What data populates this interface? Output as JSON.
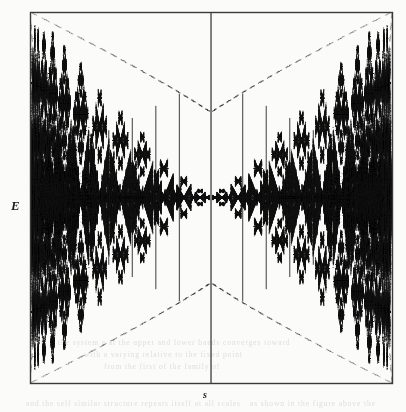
{
  "figure": {
    "kind": "scientific-figure-scan",
    "title_visible": "",
    "background_color": "#fbfbfa",
    "ink_color": "#141414",
    "frame": {
      "color": "#3a3a3a",
      "line_width": 1.4,
      "x": 30,
      "y": 12,
      "width": 362,
      "height": 371
    },
    "axes": {
      "y_label": "E",
      "y_label_style": "italic",
      "x_label": "s",
      "x_label_style": "italic",
      "ticks_visible": false,
      "tick_labels": [],
      "gridlines": false
    }
  },
  "chart_data": {
    "type": "scatter",
    "title": "",
    "xlabel": "s",
    "ylabel": "E",
    "xlim": [
      -1,
      1
    ],
    "ylim": [
      -1,
      1
    ],
    "grid": false,
    "legend": null,
    "symmetry": [
      "mirror-x",
      "mirror-y"
    ],
    "focal_points": [
      {
        "x": -0.95,
        "y": 0.0,
        "weight": 1.0
      },
      {
        "x": 0.95,
        "y": 0.0,
        "weight": 1.0
      }
    ],
    "central_axis_line": {
      "x": 0.0,
      "from_y": -1.0,
      "to_y": 1.0,
      "weight": 0.85
    },
    "band_centers_right": [
      0.06,
      0.15,
      0.26,
      0.38,
      0.5,
      0.615,
      0.72,
      0.81,
      0.875,
      0.923,
      0.955,
      0.974,
      0.986
    ],
    "band_widths_right": [
      0.03,
      0.042,
      0.055,
      0.062,
      0.06,
      0.055,
      0.048,
      0.04,
      0.032,
      0.024,
      0.017,
      0.012,
      0.008
    ],
    "band_amplitudes": [
      0.03,
      0.075,
      0.135,
      0.2,
      0.265,
      0.33,
      0.39,
      0.44,
      0.48,
      0.505,
      0.52,
      0.528,
      0.532
    ],
    "vertical_separators_right": [
      0.175,
      0.305,
      0.435,
      0.565,
      0.685,
      0.785,
      0.862
    ],
    "envelope_arcs": [
      {
        "from": [
          -1.0,
          1.0
        ],
        "to": [
          0.0,
          0.46
        ],
        "style": "dotted"
      },
      {
        "from": [
          1.0,
          1.0
        ],
        "to": [
          0.0,
          0.46
        ],
        "style": "dotted"
      },
      {
        "from": [
          -1.0,
          -1.0
        ],
        "to": [
          0.0,
          -0.46
        ],
        "style": "dotted"
      },
      {
        "from": [
          1.0,
          -1.0
        ],
        "to": [
          0.0,
          -0.46
        ],
        "style": "dotted"
      },
      {
        "from": [
          -1.0,
          1.0
        ],
        "to": [
          -0.93,
          0.0
        ],
        "style": "dotted"
      },
      {
        "from": [
          -1.0,
          -1.0
        ],
        "to": [
          -0.93,
          0.0
        ],
        "style": "dotted"
      },
      {
        "from": [
          1.0,
          1.0
        ],
        "to": [
          0.93,
          0.0
        ],
        "style": "dotted"
      },
      {
        "from": [
          1.0,
          -1.0
        ],
        "to": [
          0.93,
          0.0
        ],
        "style": "dotted"
      }
    ],
    "point_count_estimate": 48000,
    "render_seed": 20240517,
    "n_levels": 6
  },
  "ghost_text": {
    "note": "faint show-through of printed text from the reverse of the scanned page",
    "color": "#c9c6c2",
    "lines": [
      {
        "text": "the system a at the upper and lower bands converges toward",
        "x": 58,
        "y": 338,
        "size": 7.5,
        "rotate": 0
      },
      {
        "text": "with a varying   relative to   the fixed   point",
        "x": 84,
        "y": 350,
        "size": 7.5,
        "rotate": 0
      },
      {
        "text": "from  the first  of  the   family  of",
        "x": 104,
        "y": 362,
        "size": 7.5,
        "rotate": 0
      },
      {
        "text": "and the self similar structure repeats itself at all scales",
        "x": 26,
        "y": 399,
        "size": 7.5,
        "rotate": 0
      },
      {
        "text": "as shown in the figure above the",
        "x": 250,
        "y": 399,
        "size": 7.5,
        "rotate": 0
      }
    ]
  }
}
